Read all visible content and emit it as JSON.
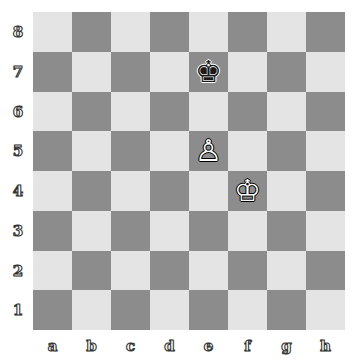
{
  "board": {
    "files": [
      "a",
      "b",
      "c",
      "d",
      "e",
      "f",
      "g",
      "h"
    ],
    "ranks": [
      "8",
      "7",
      "6",
      "5",
      "4",
      "3",
      "2",
      "1"
    ],
    "colors": {
      "light": "#e4e4e4",
      "dark": "#8c8c8c"
    },
    "pieces": [
      {
        "square": "e7",
        "color": "black",
        "type": "king",
        "glyph": "♚"
      },
      {
        "square": "e5",
        "color": "white",
        "type": "pawn",
        "glyph": "♙"
      },
      {
        "square": "f4",
        "color": "white",
        "type": "king",
        "glyph": "♔"
      }
    ]
  }
}
